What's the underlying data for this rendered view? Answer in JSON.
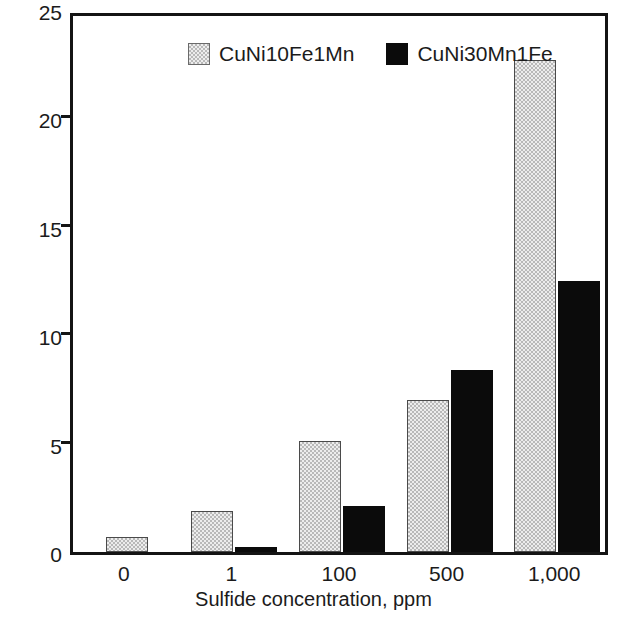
{
  "chart_data": {
    "type": "bar",
    "title": "",
    "xlabel": "Sulfide concentration, ppm",
    "ylabel": "Corrosion rate, mm/a",
    "categories": [
      "0",
      "1",
      "100",
      "500",
      "1,000"
    ],
    "series": [
      {
        "name": "CuNi10Fe1Mn",
        "values": [
          0.7,
          1.9,
          5.1,
          7.0,
          22.7
        ],
        "color": "#ededed",
        "fill": "hatched"
      },
      {
        "name": "CuNi30Mn1Fe",
        "values": [
          null,
          0.25,
          2.1,
          8.4,
          12.5
        ],
        "color": "#0b0b0b",
        "fill": "solid"
      }
    ],
    "ylim": [
      0,
      25
    ],
    "yticks": [
      "0",
      "5",
      "10",
      "15",
      "20",
      "25"
    ],
    "ytick_values": [
      0,
      5,
      10,
      15,
      20,
      25
    ],
    "grid": false,
    "legend_position": "top-center"
  },
  "legend": {
    "items": [
      {
        "label": "CuNi10Fe1Mn",
        "swatch": "hatched-swatch"
      },
      {
        "label": "CuNi30Mn1Fe",
        "swatch": "black-swatch"
      }
    ]
  }
}
